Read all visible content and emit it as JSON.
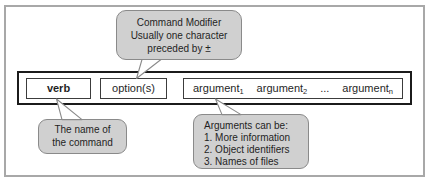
{
  "colors": {
    "page_bg": "#ffffff",
    "frame_border": "#a8a8a8",
    "bar_border": "#1b1b1b",
    "box_border": "#3c3c3c",
    "callout_fill": "#d0d0d0",
    "callout_border": "#8a8a8a",
    "text": "#1f1f1f"
  },
  "callouts": {
    "option_note": {
      "lines": [
        "Command Modifier",
        "Usually one character",
        "preceded by ±"
      ]
    },
    "verb_note": {
      "lines": [
        "The name of",
        "the command"
      ]
    },
    "argument_note": {
      "lines": [
        "Arguments can be:",
        "1. More information",
        "2. Object identifiers",
        "3. Names of files"
      ]
    }
  },
  "command_bar": {
    "verb_label": "verb",
    "options_label": "option(s)",
    "arguments": [
      {
        "base": "argument",
        "sub": "1"
      },
      {
        "base": "argument",
        "sub": "2"
      },
      {
        "base": "...",
        "sub": ""
      },
      {
        "base": "argument",
        "sub": "n"
      }
    ]
  }
}
